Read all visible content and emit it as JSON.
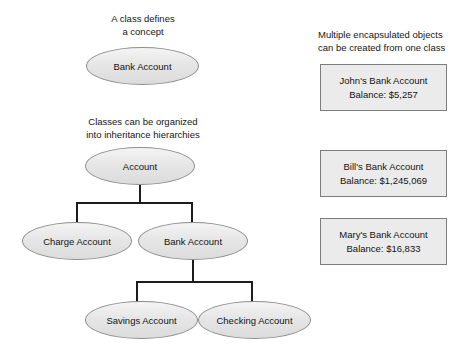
{
  "diagram": {
    "title_captions": {
      "class_defines": "A class defines\na concept",
      "inheritance": "Classes can be organized\ninto inheritance hierarchies",
      "objects": "Multiple encapsulated objects\ncan be created from one class"
    },
    "class_nodes": {
      "bank_account_top": "Bank Account",
      "account": "Account",
      "charge_account": "Charge Account",
      "bank_account_sub": "Bank Account",
      "savings_account": "Savings Account",
      "checking_account": "Checking Account"
    },
    "object_boxes": [
      {
        "name": "John's Bank Account",
        "balance": "Balance: $5,257"
      },
      {
        "name": "Bill's Bank Account",
        "balance": "Balance: $1,245,069"
      },
      {
        "name": "Mary's Bank Account",
        "balance": "Balance: $16,833"
      }
    ],
    "colors": {
      "page_background": "#ffffff",
      "ellipse_fill": "#e6e6e6",
      "ellipse_border": "#8d8d8d",
      "box_fill": "#ebebeb",
      "box_border": "#7d7d7d",
      "connector": "#1c1c1c",
      "text": "#141414"
    }
  }
}
